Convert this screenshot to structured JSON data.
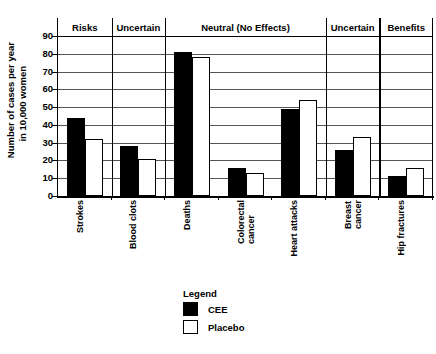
{
  "chart_data": {
    "type": "bar",
    "title": "",
    "xlabel": "",
    "ylabel_line1": "Number of cases per year",
    "ylabel_line2": "in 10,000 women",
    "ylim": [
      0,
      90
    ],
    "ytick_step": 10,
    "yticks": [
      "90",
      "80",
      "70",
      "60",
      "50",
      "40",
      "30",
      "20",
      "10",
      "0"
    ],
    "grid": true,
    "gridlines_full_width": [
      80,
      70
    ],
    "legend_position": "bottom-center",
    "categories": [
      "Strokes",
      "Blood clots",
      "Deaths",
      "Colorectal cancer",
      "Heart attacks",
      "Breast cancer",
      "Hip fractures"
    ],
    "category_labels": [
      "Strokes",
      "Blood clots",
      "Deaths",
      "Colorectal\ncancer",
      "Heart attacks",
      "Breast\ncancer",
      "Hip fractures"
    ],
    "series": [
      {
        "name": "CEE",
        "color": "#000000",
        "values": [
          44,
          28,
          81,
          16,
          49,
          26,
          11
        ]
      },
      {
        "name": "Placebo",
        "color": "#ffffff",
        "values": [
          32,
          21,
          78,
          13,
          54,
          33,
          16
        ]
      }
    ],
    "group_headers": [
      {
        "label": "Risks",
        "span": [
          "Strokes"
        ]
      },
      {
        "label": "Uncertain",
        "span": [
          "Blood clots"
        ]
      },
      {
        "label": "Neutral (No Effects)",
        "span": [
          "Deaths",
          "Colorectal cancer",
          "Heart attacks"
        ]
      },
      {
        "label": "Uncertain",
        "span": [
          "Breast cancer"
        ]
      },
      {
        "label": "Benefits",
        "span": [
          "Hip fractures"
        ]
      }
    ]
  },
  "legend": {
    "title": "Legend",
    "entries": [
      {
        "label": "CEE",
        "swatch": "filled-black-square"
      },
      {
        "label": "Placebo",
        "swatch": "outlined-white-square"
      }
    ]
  }
}
